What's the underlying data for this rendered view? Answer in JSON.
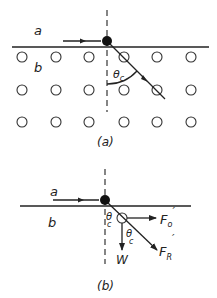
{
  "diagram_a": {
    "caption": "(a)",
    "label_a": "a",
    "label_b": "b",
    "angle_label": "θ",
    "angle_subscript": "c",
    "lattice": {
      "rows_y": [
        57,
        90,
        122
      ],
      "cols_x": [
        22,
        56,
        89,
        124,
        157,
        191
      ],
      "radius": 5
    }
  },
  "diagram_b": {
    "caption": "(b)",
    "label_a": "a",
    "label_b": "b",
    "angle_label_1": "θ",
    "angle_subscript_1": "c",
    "angle_label_2": "θ",
    "angle_subscript_2": "c",
    "force_F0": "F",
    "force_F0_sub": "o",
    "force_F0_prime": "′",
    "force_W": "W",
    "force_FR": "F",
    "force_FR_sub": "R",
    "force_FR_prime": "′"
  },
  "colors": {
    "ink": "#222222",
    "background": "#ffffff"
  }
}
